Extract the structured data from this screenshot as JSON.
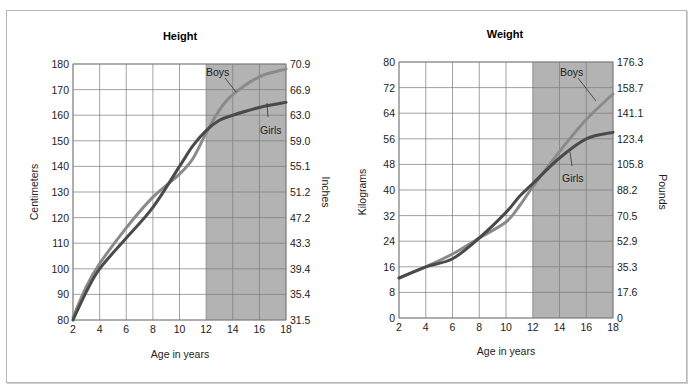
{
  "chart_data": [
    {
      "type": "line",
      "title": "Height",
      "xlabel": "Age in years",
      "ylabel": "Centimeters",
      "ylabel_right": "Inches",
      "x_ticks": [
        2,
        4,
        6,
        8,
        10,
        12,
        14,
        16,
        18
      ],
      "y_ticks": [
        80,
        90,
        100,
        110,
        120,
        130,
        140,
        150,
        160,
        170,
        180
      ],
      "y_ticks_right": [
        "31.5",
        "35.4",
        "39.4",
        "43.3",
        "47.2",
        "51.2",
        "55.1",
        "59.0",
        "63.0",
        "66.9",
        "70.9"
      ],
      "xlim": [
        2,
        18
      ],
      "ylim": [
        80,
        180
      ],
      "grid": true,
      "shaded_region": {
        "x_from": 12,
        "x_to": 18,
        "color": "#b3b3b3"
      },
      "series": [
        {
          "name": "Boys",
          "color": "#8a8a8a",
          "x": [
            2,
            3,
            4,
            6,
            8,
            10,
            11,
            12,
            13,
            14,
            16,
            18
          ],
          "values": [
            81,
            93,
            102,
            116,
            128,
            137,
            143,
            153,
            162,
            168,
            175,
            178
          ]
        },
        {
          "name": "Girls",
          "color": "#4a4a4a",
          "x": [
            2,
            3,
            4,
            6,
            8,
            10,
            11,
            12,
            13,
            14,
            16,
            18
          ],
          "values": [
            80,
            91,
            100,
            112,
            124,
            140,
            148,
            154,
            158,
            160,
            163,
            165
          ]
        }
      ]
    },
    {
      "type": "line",
      "title": "Weight",
      "xlabel": "Age in years",
      "ylabel": "Kilograms",
      "ylabel_right": "Pounds",
      "x_ticks": [
        2,
        4,
        6,
        8,
        10,
        12,
        14,
        16,
        18
      ],
      "y_ticks": [
        0,
        8,
        16,
        24,
        32,
        40,
        48,
        56,
        64,
        72,
        80
      ],
      "y_ticks_right": [
        "0",
        "17.6",
        "35.3",
        "52.9",
        "70.5",
        "88.2",
        "105.8",
        "123.4",
        "141.1",
        "158.7",
        "176.3"
      ],
      "xlim": [
        2,
        18
      ],
      "ylim": [
        0,
        80
      ],
      "grid": true,
      "shaded_region": {
        "x_from": 12,
        "x_to": 18,
        "color": "#b3b3b3"
      },
      "series": [
        {
          "name": "Boys",
          "color": "#8a8a8a",
          "x": [
            2,
            4,
            6,
            8,
            10,
            11,
            12,
            14,
            16,
            18
          ],
          "values": [
            12.5,
            16,
            20,
            25,
            30,
            35,
            41,
            52,
            62,
            70
          ]
        },
        {
          "name": "Girls",
          "color": "#4a4a4a",
          "x": [
            2,
            4,
            6,
            8,
            10,
            11,
            12,
            14,
            16,
            18
          ],
          "values": [
            12.5,
            16,
            18.5,
            25,
            33,
            38,
            42,
            50,
            56,
            58
          ]
        }
      ]
    }
  ],
  "labels": {
    "height_title": "Height",
    "weight_title": "Weight",
    "x_axis": "Age in years",
    "cm": "Centimeters",
    "inches": "Inches",
    "kg": "Kilograms",
    "lb": "Pounds",
    "boys": "Boys",
    "girls": "Girls"
  }
}
